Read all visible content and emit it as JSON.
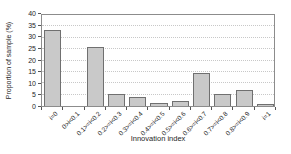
{
  "chart_data": {
    "type": "bar",
    "title": "",
    "xlabel": "Innovation index",
    "ylabel": "Proportion of sample (%)",
    "ylim": [
      0,
      40
    ],
    "ytick_step": 5,
    "grid": "horizontal dotted",
    "legend": "none",
    "categories": [
      "i=0",
      "0>i<0.1",
      "0.1>=i<0.2",
      "0.2>=i<0.3",
      "0.3>=i<0.4",
      "0.4>=i<0.5",
      "0.5>=i<0.6",
      "0.6>=i<0.7",
      "0.7>=i<0.8",
      "0.8>=i<0.9",
      "i=1"
    ],
    "values": [
      33.5,
      0,
      26,
      5.5,
      4,
      1.3,
      2.2,
      14.5,
      5.5,
      7,
      0.7
    ],
    "colors": {
      "bar_fill": "#c9c9c9",
      "bar_border": "#707070",
      "gridline": "#c8c8c8",
      "frame": "#8c8c8c",
      "text": "#262626"
    }
  }
}
